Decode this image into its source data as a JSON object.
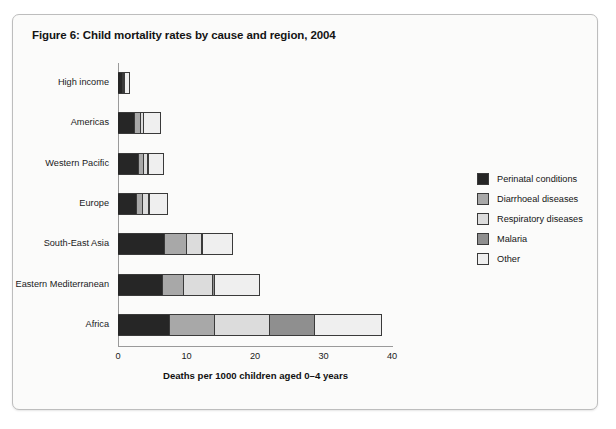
{
  "figure": {
    "title": "Figure 6: Child mortality rates by cause and region, 2004"
  },
  "chart_data": {
    "type": "bar",
    "orientation": "horizontal",
    "stacked": true,
    "title": "Figure 6: Child mortality rates by cause and region, 2004",
    "xlabel": "Deaths per 1000 children aged 0–4 years",
    "ylabel": "",
    "xlim": [
      0,
      40
    ],
    "xticks": [
      0,
      10,
      20,
      30,
      40
    ],
    "xtick_labels": [
      "0",
      "10",
      "20",
      "30",
      "40"
    ],
    "grid": false,
    "legend_position": "right",
    "categories": [
      "High income",
      "Americas",
      "Western Pacific",
      "Europe",
      "South-East Asia",
      "Eastern Mediterranean",
      "Africa"
    ],
    "series": [
      {
        "name": "Perinatal conditions",
        "color": "#262626",
        "values": [
          0.8,
          2.5,
          3.0,
          2.8,
          6.8,
          6.6,
          7.6
        ]
      },
      {
        "name": "Diarrhoeal diseases",
        "color": "#a8a8a8",
        "values": [
          0.05,
          0.8,
          0.8,
          0.9,
          3.3,
          3.1,
          6.5
        ]
      },
      {
        "name": "Respiratory diseases",
        "color": "#dcdcdc",
        "values": [
          0.05,
          0.5,
          0.6,
          0.9,
          2.1,
          4.2,
          8.1
        ]
      },
      {
        "name": "Malaria",
        "color": "#8f8f8f",
        "values": [
          0.0,
          0.0,
          0.1,
          0.05,
          0.1,
          0.3,
          6.6
        ]
      },
      {
        "name": "Other",
        "color": "#efefef",
        "values": [
          0.6,
          2.5,
          2.2,
          2.5,
          4.4,
          6.6,
          9.8
        ]
      }
    ],
    "totals": [
      1.5,
      6.3,
      6.7,
      7.15,
      16.7,
      20.8,
      38.6
    ]
  },
  "legend": {
    "items": [
      {
        "label": "Perinatal conditions",
        "color": "#262626"
      },
      {
        "label": "Diarrhoeal diseases",
        "color": "#a8a8a8"
      },
      {
        "label": "Respiratory diseases",
        "color": "#dcdcdc"
      },
      {
        "label": "Malaria",
        "color": "#8f8f8f"
      },
      {
        "label": "Other",
        "color": "#efefef"
      }
    ]
  }
}
